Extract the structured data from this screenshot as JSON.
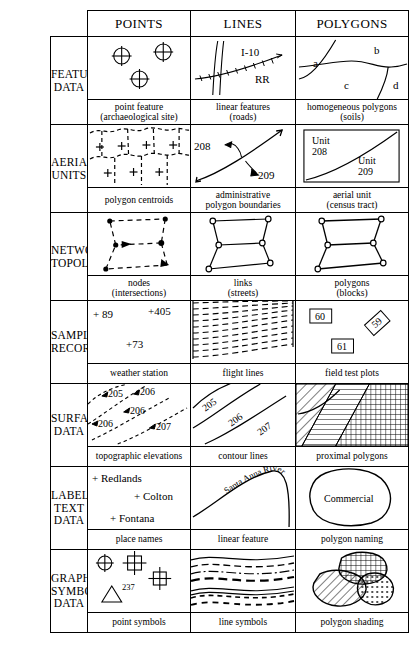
{
  "figure": {
    "type": "gis-data-types-matrix",
    "columns": [
      "POINTS",
      "LINES",
      "POLYGONS"
    ],
    "row_label_column_header": ""
  },
  "rows": [
    {
      "label": "FEATURE DATA",
      "label_lines": [
        "FEATURE",
        "DATA"
      ],
      "cells": [
        {
          "caption_lines": [
            "point feature",
            "(archaeological site)"
          ],
          "graphic": "three-crosshair-circle-point-symbols",
          "labels": []
        },
        {
          "caption_lines": [
            "linear features",
            "(roads)"
          ],
          "graphic": "interstate-highway-and-railroad-lines",
          "labels": [
            "I-10",
            "RR"
          ]
        },
        {
          "caption_lines": [
            "homogeneous polygons",
            "(soils)"
          ],
          "graphic": "four-soil-polygons",
          "labels": [
            "a",
            "b",
            "c",
            "d"
          ]
        }
      ]
    },
    {
      "label": "AERIAL UNITS",
      "label_lines": [
        "AERIAL",
        "UNITS"
      ],
      "cells": [
        {
          "caption_lines": [
            "polygon centroids"
          ],
          "graphic": "dashed-polygon-mesh-with-plus-centroids",
          "labels": []
        },
        {
          "caption_lines": [
            "administrative",
            "polygon boundaries"
          ],
          "graphic": "boundary-line-with-two-side-arrows",
          "labels": [
            "208",
            "209"
          ]
        },
        {
          "caption_lines": [
            "aerial unit",
            "(census tract)"
          ],
          "graphic": "rectangle-split-by-curve-into-two-units",
          "labels": [
            "Unit",
            "208",
            "Unit",
            "209"
          ]
        }
      ]
    },
    {
      "label": "NETWORK TOPOLOGY",
      "label_lines": [
        "NETWORK",
        "TOPOLOGY"
      ],
      "cells": [
        {
          "caption_lines": [
            "nodes",
            "(intersections)"
          ],
          "graphic": "filled-nodes-with-dashed-links",
          "labels": []
        },
        {
          "caption_lines": [
            "links",
            "(streets)"
          ],
          "graphic": "network-links-with-open-nodes",
          "labels": []
        },
        {
          "caption_lines": [
            "polygons",
            "(blocks)"
          ],
          "graphic": "network-enclosed-block-polygons",
          "labels": []
        }
      ]
    },
    {
      "label": "SAMPLING RECORDS",
      "label_lines": [
        "SAMPLING",
        "RECORDS"
      ],
      "cells": [
        {
          "caption_lines": [
            "weather station"
          ],
          "graphic": "three-plus-marked-stations-with-values",
          "labels": [
            "+ 89",
            "+405",
            "+73"
          ]
        },
        {
          "caption_lines": [
            "flight lines"
          ],
          "graphic": "parallel-dashed-flight-lines",
          "labels": []
        },
        {
          "caption_lines": [
            "field test plots"
          ],
          "graphic": "three-numbered-test-plot-boxes",
          "labels": [
            "60",
            "59",
            "61"
          ]
        }
      ]
    },
    {
      "label": "SURFACE DATA",
      "label_lines": [
        "SURFACE",
        "DATA"
      ],
      "cells": [
        {
          "caption_lines": [
            "topographic elevations"
          ],
          "graphic": "dashed-elevation-traces-with-spot-values",
          "labels": [
            "205",
            "206",
            "206",
            "206",
            "207"
          ]
        },
        {
          "caption_lines": [
            "contour lines"
          ],
          "graphic": "three-labelled-contour-lines",
          "labels": [
            "205",
            "206",
            "207"
          ]
        },
        {
          "caption_lines": [
            "proximal polygons"
          ],
          "graphic": "three-hatched-proximal-polygons",
          "labels": []
        }
      ]
    },
    {
      "label": "LABEL/TEXT DATA",
      "label_lines": [
        "LABEL/",
        "TEXT",
        "DATA"
      ],
      "cells": [
        {
          "caption_lines": [
            "place names"
          ],
          "graphic": "plus-marked-place-name-labels",
          "labels": [
            "+ Redlands",
            "+ Colton",
            "+ Fontana"
          ]
        },
        {
          "caption_lines": [
            "linear feature"
          ],
          "graphic": "river-line-with-curved-text-label",
          "labels": [
            "Santa Anna River"
          ]
        },
        {
          "caption_lines": [
            "polygon naming"
          ],
          "graphic": "closed-polygon-with-interior-name",
          "labels": [
            "Commercial"
          ]
        }
      ]
    },
    {
      "label": "GRAPHIC SYMBOL DATA",
      "label_lines": [
        "GRAPHIC",
        "SYMBOL",
        "DATA"
      ],
      "cells": [
        {
          "caption_lines": [
            "point symbols"
          ],
          "graphic": "crosshair-circle-crossed-squares-and-triangle",
          "labels": [
            "237"
          ]
        },
        {
          "caption_lines": [
            "line symbols"
          ],
          "graphic": "stacked-varied-dash-line-styles",
          "labels": []
        },
        {
          "caption_lines": [
            "polygon shading"
          ],
          "graphic": "three-overlapping-pattern-filled-blobs",
          "labels": []
        }
      ]
    }
  ],
  "style": {
    "ink": "#000000",
    "paper": "#ffffff"
  }
}
